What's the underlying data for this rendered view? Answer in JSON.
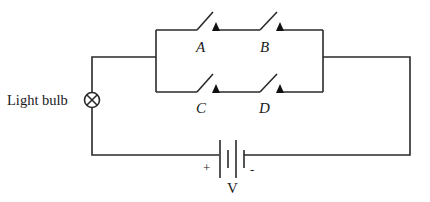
{
  "diagram": {
    "type": "circuit",
    "components": {
      "bulb": {
        "label": "Light bulb",
        "symbol": "lamp-cross-circle"
      },
      "switches": [
        {
          "label": "A",
          "branch": "top",
          "state": "open"
        },
        {
          "label": "B",
          "branch": "top",
          "state": "open"
        },
        {
          "label": "C",
          "branch": "bottom",
          "state": "open"
        },
        {
          "label": "D",
          "branch": "bottom",
          "state": "open"
        }
      ],
      "battery": {
        "label": "V",
        "positive": "+",
        "negative": "-"
      }
    },
    "topology": "Battery in series with light bulb and a parallel block; top branch has switches A and B in series, bottom branch has switches C and D in series",
    "colors": {
      "line": "#2a2a2a",
      "background": "#ffffff"
    }
  }
}
